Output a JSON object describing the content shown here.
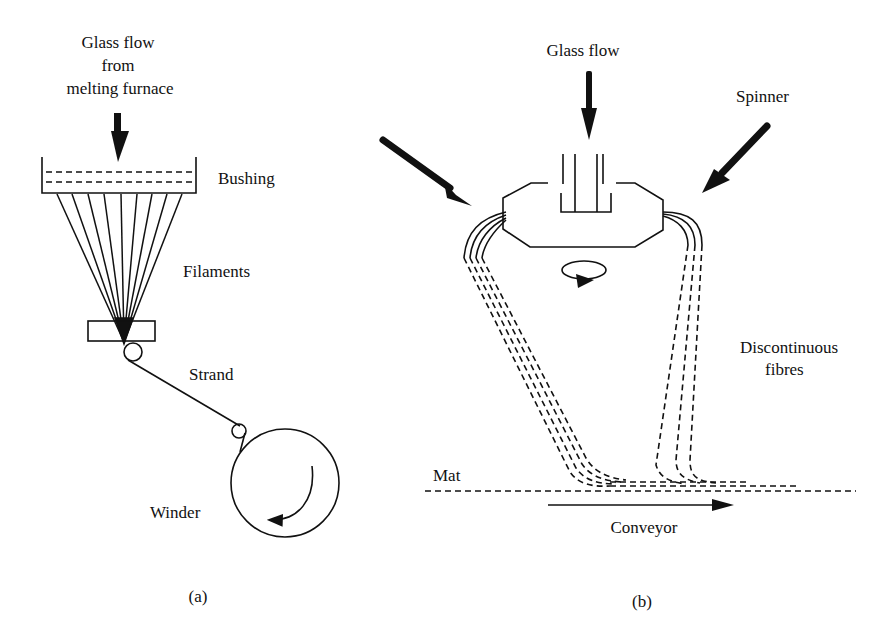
{
  "panel_a": {
    "caption": "(a)",
    "labels": {
      "glass_flow_line1": "Glass flow",
      "glass_flow_line2": "from",
      "glass_flow_line3": "melting furnace",
      "bushing": "Bushing",
      "filaments": "Filaments",
      "strand": "Strand",
      "winder": "Winder"
    }
  },
  "panel_b": {
    "caption": "(b)",
    "labels": {
      "glass_flow": "Glass flow",
      "spinner": "Spinner",
      "discontinuous_line1": "Discontinuous",
      "discontinuous_line2": "fibres",
      "mat": "Mat",
      "conveyor": "Conveyor"
    }
  }
}
